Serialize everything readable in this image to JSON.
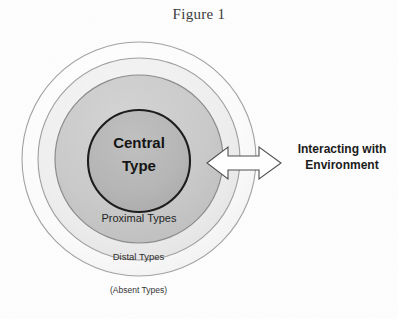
{
  "figure": {
    "title": "Figure 1",
    "background_color": "#fdfdfd"
  },
  "diagram": {
    "type": "concentric-circles",
    "rings": [
      {
        "id": "outer",
        "label": "(Absent Types)",
        "fill_color": "#fafafa",
        "stroke_color": "#9a9a9a",
        "center_x": 139,
        "center_y": 159,
        "radius": 117
      },
      {
        "id": "distal",
        "label": "Distal Types",
        "fill_color": "#ececed",
        "stroke_color": "#9a9a9a",
        "center_x": 139,
        "center_y": 159,
        "radius": 101
      },
      {
        "id": "proximal",
        "label": "Proximal Types",
        "fill_color": "#c9cac9",
        "stroke_color": "#8e8e8e",
        "center_x": 139,
        "center_y": 159,
        "radius": 84
      },
      {
        "id": "central",
        "label": "Central\nType",
        "fill_color": "#b4b5b4",
        "stroke_color": "#1a1a1a",
        "center_x": 139,
        "center_y": 161,
        "radius": 51
      }
    ],
    "central_label_line1": "Central",
    "central_label_line2": "Type",
    "proximal_label": "Proximal Types",
    "distal_label": "Distal Types",
    "absent_label": "(Absent Types)",
    "arrow": {
      "name": "double-headed-arrow",
      "direction": "bidirectional-horizontal",
      "fill_color": "#ffffff",
      "stroke_color": "#4a4a4a",
      "x_start": 207,
      "x_end": 281,
      "y_center": 163
    },
    "environment_label_line1": "Interacting with",
    "environment_label_line2": "Environment"
  }
}
